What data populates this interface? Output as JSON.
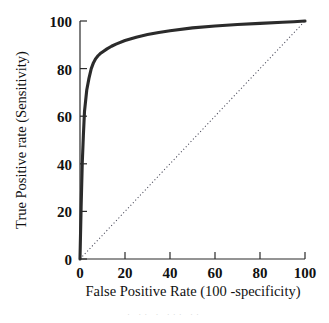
{
  "chart_data": {
    "type": "line",
    "title": "",
    "xlabel": "False Positive Rate (100 -specificity)",
    "ylabel": "True Positive rate (Sensitivity)",
    "xlim": [
      0,
      100
    ],
    "ylim": [
      0,
      100
    ],
    "xticks": [
      "0",
      "20",
      "40",
      "60",
      "80",
      "100"
    ],
    "yticks": [
      "0",
      "20",
      "40",
      "60",
      "80",
      "100"
    ],
    "xtick_values": [
      0,
      20,
      40,
      60,
      80,
      100
    ],
    "ytick_values": [
      0,
      20,
      40,
      60,
      80,
      100
    ],
    "grid": false,
    "legend": "none",
    "series": [
      {
        "name": "ROC curve",
        "style": "solid",
        "color": "#2b2b2b",
        "x": [
          0,
          0.5,
          1,
          1.5,
          2,
          3,
          4,
          5,
          6,
          7,
          8,
          9,
          10,
          12,
          14,
          16,
          20,
          25,
          30,
          35,
          40,
          50,
          60,
          70,
          80,
          90,
          95,
          100
        ],
        "y": [
          0,
          22,
          40,
          52,
          62,
          71,
          76,
          80,
          82.5,
          84.2,
          85.4,
          86.3,
          87,
          88.3,
          89.4,
          90.3,
          91.8,
          93.2,
          94.3,
          95.2,
          95.9,
          97.1,
          97.9,
          98.5,
          99,
          99.5,
          99.7,
          100
        ]
      },
      {
        "name": "Chance line",
        "style": "dotted",
        "color": "#4a4a5a",
        "x": [
          0,
          100
        ],
        "y": [
          0,
          100
        ]
      }
    ]
  },
  "caption": {
    "fragment": "·  ··  ·   ···  ··"
  }
}
